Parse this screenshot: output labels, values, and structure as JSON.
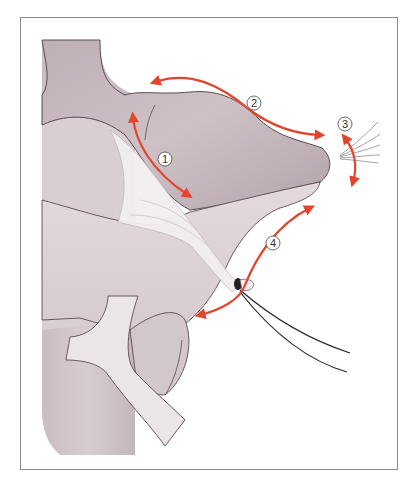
{
  "figure": {
    "type": "anatomical-illustration",
    "labels": [
      {
        "id": 1,
        "text": "1",
        "x": 165,
        "y": 159
      },
      {
        "id": 2,
        "text": "2",
        "x": 254,
        "y": 103
      },
      {
        "id": 3,
        "text": "3",
        "x": 345,
        "y": 124
      },
      {
        "id": 4,
        "text": "4",
        "x": 273,
        "y": 243
      }
    ],
    "colors": {
      "tissue": "#cbbfc4",
      "tissue_shadow": "#b5a6ad",
      "tissue_light": "#e6dde0",
      "outline": "#5a4a52",
      "arrow": "#e2452c",
      "frame": "#8a8a8a",
      "suture": "#222222"
    }
  }
}
